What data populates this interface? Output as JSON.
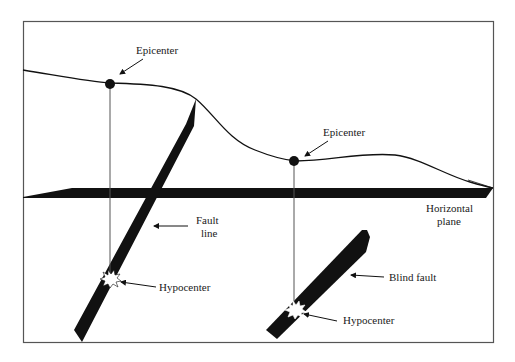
{
  "diagram": {
    "type": "fault-cross-section",
    "labels": {
      "epicenter_1": "Epicenter",
      "epicenter_2": "Epicenter",
      "fault_line_1": "Fault",
      "fault_line_2": "line",
      "hypocenter_1": "Hypocenter",
      "hypocenter_2": "Hypocenter",
      "horizontal_plane_1": "Horizontal",
      "horizontal_plane_2": "plane",
      "blind_fault": "Blind fault"
    },
    "colors": {
      "ink": "#111111",
      "frame": "#555555",
      "background": "#ffffff"
    }
  }
}
